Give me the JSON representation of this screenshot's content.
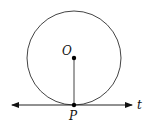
{
  "diagram": {
    "labels": {
      "center": "O",
      "tangent_point": "P",
      "tangent_line": "t"
    },
    "geometry": {
      "circle_center": [
        74,
        58
      ],
      "circle_radius": 47,
      "tangent_y": 105,
      "tangent_x_start": 10,
      "tangent_x_end": 134
    },
    "colors": {
      "stroke": "#444444",
      "point": "#000000"
    }
  }
}
